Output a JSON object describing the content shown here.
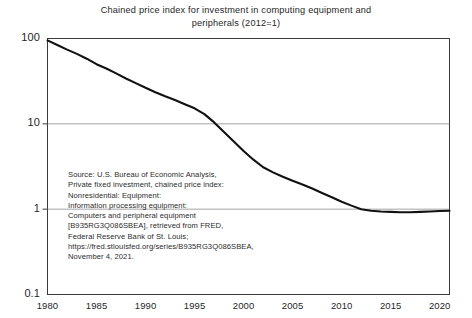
{
  "chart_data": {
    "type": "line",
    "title": "Chained price index for investment in computing equipment and peripherals (2012=1)",
    "title_line1": "Chained price index for investment in computing equipment and",
    "title_line2": "peripherals (2012=1)",
    "xlabel": "",
    "ylabel": "",
    "yscale": "log",
    "ylim": [
      0.1,
      100
    ],
    "xlim": [
      1980,
      2021
    ],
    "grid": true,
    "grid_axis": "y",
    "legend": false,
    "line_color": "#111111",
    "ytick_labels": [
      "100",
      "10",
      "1",
      "0.1"
    ],
    "ytick_values": [
      100,
      10,
      1,
      0.1
    ],
    "xtick_labels": [
      "1980",
      "1985",
      "1990",
      "1995",
      "2000",
      "2005",
      "2010",
      "2015",
      "2020"
    ],
    "xtick_values": [
      1980,
      1985,
      1990,
      1995,
      2000,
      2005,
      2010,
      2015,
      2020
    ],
    "x": [
      1980,
      1981,
      1982,
      1983,
      1984,
      1985,
      1986,
      1987,
      1988,
      1989,
      1990,
      1991,
      1992,
      1993,
      1994,
      1995,
      1996,
      1997,
      1998,
      1999,
      2000,
      2001,
      2002,
      2003,
      2004,
      2005,
      2006,
      2007,
      2008,
      2009,
      2010,
      2011,
      2012,
      2013,
      2014,
      2015,
      2016,
      2017,
      2018,
      2019,
      2020,
      2021
    ],
    "values": [
      95.0,
      84.0,
      74.0,
      66.0,
      58.0,
      50.0,
      44.5,
      39.0,
      34.0,
      30.0,
      26.5,
      23.5,
      21.0,
      19.0,
      17.0,
      15.2,
      13.0,
      10.4,
      8.0,
      6.2,
      4.8,
      3.8,
      3.1,
      2.7,
      2.4,
      2.15,
      1.95,
      1.75,
      1.55,
      1.38,
      1.22,
      1.1,
      1.0,
      0.96,
      0.94,
      0.93,
      0.92,
      0.92,
      0.93,
      0.94,
      0.95,
      0.96
    ],
    "annotation": {
      "lines": [
        "Source: U.S. Bureau of Economic Analysis,",
        "Private fixed investment, chained price index:",
        "Nonresidential: Equipment:",
        "Information processing equipment:",
        "Computers and peripheral equipment",
        "[B935RG3Q086SBEA], retrieved from FRED,",
        "Federal Reserve Bank of St. Louis;",
        "https://fred.stlouisfed.org/series/B935RG3Q086SBEA,",
        "November 4, 2021."
      ]
    }
  }
}
